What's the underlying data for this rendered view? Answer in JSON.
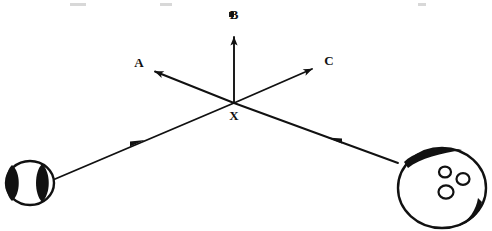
{
  "figure": {
    "type": "physics-vector-diagram",
    "background_color": "#ffffff",
    "ink_color": "#111111",
    "width": 492,
    "height": 231
  },
  "collision_point": {
    "label": "X",
    "x": 234,
    "y": 103,
    "label_x": 234,
    "label_y": 120
  },
  "direction_vectors": [
    {
      "id": "A",
      "label": "A",
      "description": "arrow from X pointing up and to the left",
      "from_x": 234,
      "from_y": 103,
      "to_x": 150,
      "to_y": 70,
      "label_x": 139,
      "label_y": 67,
      "angle_deg": 158
    },
    {
      "id": "B",
      "label": "B",
      "description": "arrow from X pointing straight up",
      "from_x": 234,
      "from_y": 103,
      "to_x": 234,
      "to_y": 29,
      "label_x": 234,
      "label_y": 19,
      "angle_deg": 90
    },
    {
      "id": "C",
      "label": "C",
      "description": "arrow from X pointing up and to the right",
      "from_x": 234,
      "from_y": 103,
      "to_x": 317,
      "to_y": 67,
      "label_x": 329,
      "label_y": 65,
      "angle_deg": 23
    }
  ],
  "motion_paths": [
    {
      "id": "baseball-path",
      "description": "baseball travels up and to the right toward X",
      "from_x": 48,
      "from_y": 182,
      "to_x": 234,
      "to_y": 103,
      "arrow_marker_x": 136,
      "arrow_marker_y": 143,
      "arrow_direction": "toward-X"
    },
    {
      "id": "bowling-ball-path",
      "description": "bowling ball travels up and to the left toward X",
      "from_x": 398,
      "from_y": 163,
      "to_x": 234,
      "to_y": 103,
      "arrow_marker_x": 334,
      "arrow_marker_y": 140,
      "arrow_direction": "toward-X"
    }
  ],
  "objects": [
    {
      "id": "baseball",
      "name": "baseball",
      "center_x": 30,
      "center_y": 183,
      "radius_x": 24,
      "radius_y": 22,
      "features": "two dark curved seam crescents on left and right"
    },
    {
      "id": "bowling-ball",
      "name": "bowling ball",
      "center_x": 442,
      "center_y": 188,
      "radius_x": 44,
      "radius_y": 40,
      "features": "three finger holes and dark shading arcs at top-left and bottom-right",
      "holes": [
        {
          "cx": 445,
          "cy": 172,
          "r": 6
        },
        {
          "cx": 463,
          "cy": 179,
          "r": 6.5
        },
        {
          "cx": 446,
          "cy": 192,
          "r": 7.5
        }
      ]
    }
  ],
  "scan_artifacts": [
    {
      "x": 70,
      "y": 3,
      "w": 16,
      "h": 3
    },
    {
      "x": 160,
      "y": 3,
      "w": 12,
      "h": 3
    },
    {
      "x": 418,
      "y": 3,
      "w": 8,
      "h": 3
    },
    {
      "x": 229,
      "y": 12,
      "w": 5,
      "h": 5
    }
  ]
}
